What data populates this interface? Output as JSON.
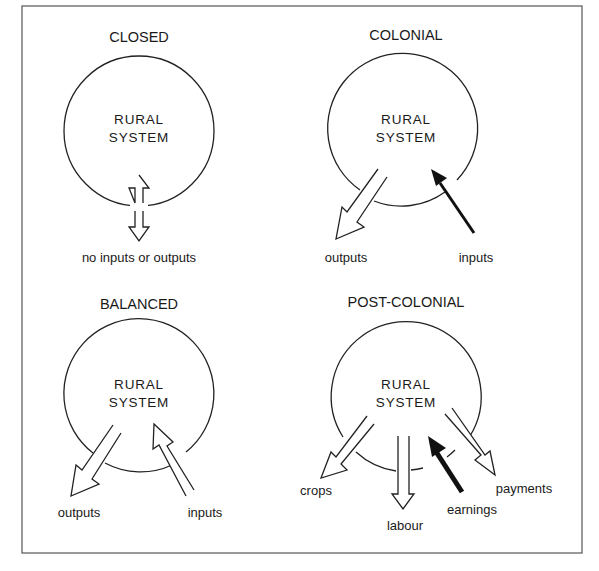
{
  "figure": {
    "frame_color": "#555555",
    "panels": [
      {
        "id": "closed",
        "title": "CLOSED",
        "system_line1": "RURAL",
        "system_line2": "SYSTEM",
        "flows": [
          {
            "label": "no inputs or outputs",
            "style": "outline",
            "direction": "bidirectional"
          }
        ]
      },
      {
        "id": "colonial",
        "title": "COLONIAL",
        "system_line1": "RURAL",
        "system_line2": "SYSTEM",
        "flows": [
          {
            "label": "outputs",
            "style": "outline",
            "direction": "out"
          },
          {
            "label": "inputs",
            "style": "solid",
            "direction": "in"
          }
        ]
      },
      {
        "id": "balanced",
        "title": "BALANCED",
        "system_line1": "RURAL",
        "system_line2": "SYSTEM",
        "flows": [
          {
            "label": "outputs",
            "style": "outline",
            "direction": "out"
          },
          {
            "label": "inputs",
            "style": "outline",
            "direction": "in"
          }
        ]
      },
      {
        "id": "post-colonial",
        "title": "POST-COLONIAL",
        "system_line1": "RURAL",
        "system_line2": "SYSTEM",
        "flows": [
          {
            "label": "crops",
            "style": "outline",
            "direction": "out"
          },
          {
            "label": "labour",
            "style": "outline",
            "direction": "out"
          },
          {
            "label": "earnings",
            "style": "solid",
            "direction": "in"
          },
          {
            "label": "payments",
            "style": "outline",
            "direction": "out"
          }
        ]
      }
    ]
  }
}
